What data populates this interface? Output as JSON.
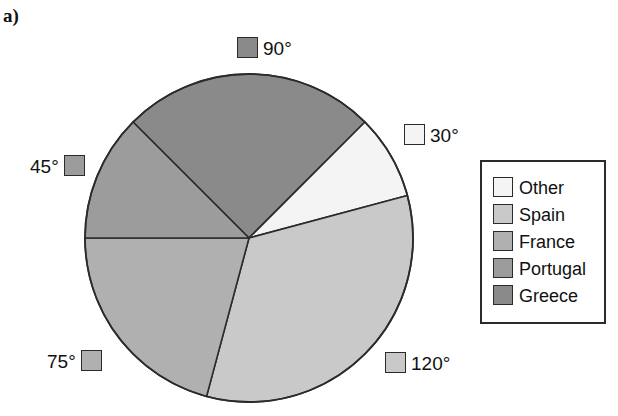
{
  "panel": {
    "label": "a)"
  },
  "colors": {
    "other": "#f4f4f4",
    "spain": "#c9c9c9",
    "france": "#b0b0b0",
    "portugal": "#9c9c9c",
    "greece": "#8a8a8a",
    "outline": "#2b2b2b",
    "background": "#ffffff"
  },
  "legend": {
    "items": [
      {
        "label": "Other",
        "color": "#f4f4f4"
      },
      {
        "label": "Spain",
        "color": "#c9c9c9"
      },
      {
        "label": "France",
        "color": "#b0b0b0"
      },
      {
        "label": "Portugal",
        "color": "#9c9c9c"
      },
      {
        "label": "Greece",
        "color": "#8a8a8a"
      }
    ]
  },
  "callouts": [
    {
      "id": "90",
      "text": "90°",
      "color": "#8a8a8a",
      "swatch_side": "left"
    },
    {
      "id": "30",
      "text": "30°",
      "color": "#f4f4f4",
      "swatch_side": "left"
    },
    {
      "id": "45",
      "text": "45°",
      "color": "#9c9c9c",
      "swatch_side": "right"
    },
    {
      "id": "75",
      "text": "75°",
      "color": "#b0b0b0",
      "swatch_side": "right"
    },
    {
      "id": "120",
      "text": "120°",
      "color": "#c9c9c9",
      "swatch_side": "left"
    }
  ],
  "chart_data": {
    "type": "pie",
    "title": "",
    "unit": "degrees",
    "total_degrees": 360,
    "center_px": [
      249,
      238
    ],
    "radius_px": 164,
    "start_angle_deg_from_12oclock": 315,
    "direction": "clockwise",
    "legend_position": "right",
    "categories": [
      "Greece",
      "Other",
      "Spain",
      "France",
      "Portugal"
    ],
    "values": [
      90,
      30,
      120,
      75,
      45
    ],
    "slices": [
      {
        "label": "Greece",
        "degrees": 90,
        "percent": 25.0,
        "color": "#8a8a8a",
        "start_deg": 315,
        "end_deg": 405,
        "data_label": "90°"
      },
      {
        "label": "Other",
        "degrees": 30,
        "percent": 8.33,
        "color": "#f4f4f4",
        "start_deg": 45,
        "end_deg": 75,
        "data_label": "30°"
      },
      {
        "label": "Spain",
        "degrees": 120,
        "percent": 33.33,
        "color": "#c9c9c9",
        "start_deg": 75,
        "end_deg": 195,
        "data_label": "120°"
      },
      {
        "label": "France",
        "degrees": 75,
        "percent": 20.83,
        "color": "#b0b0b0",
        "start_deg": 195,
        "end_deg": 270,
        "data_label": "75°"
      },
      {
        "label": "Portugal",
        "degrees": 45,
        "percent": 12.5,
        "color": "#9c9c9c",
        "start_deg": 270,
        "end_deg": 315,
        "data_label": "45°"
      }
    ]
  }
}
